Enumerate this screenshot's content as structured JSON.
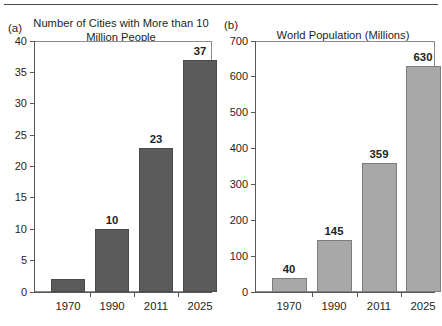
{
  "figure": {
    "has_top_rule": true,
    "background": "#ffffff"
  },
  "panels": [
    {
      "label": "(a)",
      "title": "Number of Cities with More\nthan 10 Million People",
      "bar_color": "#5b5b5b"
    },
    {
      "label": "(b)",
      "title": "World Population (Millions)",
      "bar_color": "#a8a8a8"
    }
  ],
  "chart_data": [
    {
      "type": "bar",
      "panel": "(a)",
      "title": "Number of Cities with More than 10 Million People",
      "categories": [
        "1970",
        "1990",
        "2011",
        "2025"
      ],
      "values": [
        2,
        10,
        23,
        37
      ],
      "data_labels": [
        "",
        "10",
        "23",
        "37"
      ],
      "xlabel": "",
      "ylabel": "",
      "ylim": [
        0,
        40
      ],
      "yticks": [
        0,
        5,
        10,
        15,
        20,
        25,
        30,
        35,
        40
      ],
      "ytick_labels": [
        "0",
        "5",
        "10",
        "15",
        "20",
        "25",
        "30",
        "35",
        "40"
      ],
      "grid": false,
      "legend": "none",
      "bar_color": "#5b5b5b"
    },
    {
      "type": "bar",
      "panel": "(b)",
      "title": "World Population (Millions)",
      "categories": [
        "1970",
        "1990",
        "2011",
        "2025"
      ],
      "values": [
        40,
        145,
        359,
        630
      ],
      "data_labels": [
        "40",
        "145",
        "359",
        "630"
      ],
      "xlabel": "",
      "ylabel": "",
      "ylim": [
        0,
        700
      ],
      "yticks": [
        0,
        100,
        200,
        300,
        400,
        500,
        600,
        700
      ],
      "ytick_labels": [
        "0",
        "100",
        "200",
        "300",
        "400",
        "500",
        "600",
        "700"
      ],
      "grid": false,
      "legend": "none",
      "bar_color": "#a8a8a8"
    }
  ]
}
